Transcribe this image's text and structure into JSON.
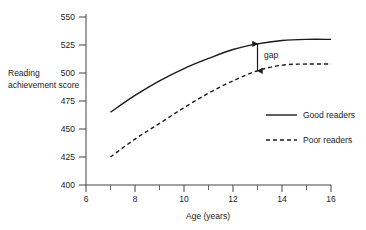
{
  "chart_data": {
    "type": "line",
    "title": "",
    "xlabel": "Age (years)",
    "ylabel": "Reading achievement score",
    "xlim": [
      6,
      16
    ],
    "ylim": [
      400,
      550
    ],
    "xticks": [
      6,
      8,
      10,
      12,
      14,
      16
    ],
    "xtick_labels": [
      "6",
      "8",
      "10",
      "12",
      "14",
      "16"
    ],
    "xminor_ticks": [
      7,
      9,
      11,
      13,
      15
    ],
    "yticks": [
      400,
      425,
      450,
      475,
      500,
      525,
      550
    ],
    "ytick_labels": [
      "400",
      "425",
      "450",
      "475",
      "500",
      "525",
      "550"
    ],
    "grid": false,
    "legend_position": "right-middle",
    "x": [
      7,
      8,
      9,
      10,
      11,
      12,
      13,
      14,
      15,
      16
    ],
    "series": [
      {
        "name": "Good readers",
        "style": "solid",
        "color": "#1a1a1a",
        "values": [
          465,
          480,
          493,
          504,
          513,
          521,
          526,
          529,
          530,
          530
        ]
      },
      {
        "name": "Poor readers",
        "style": "dashed",
        "color": "#1a1a1a",
        "values": [
          425,
          441,
          455,
          469,
          482,
          493,
          502,
          507,
          508,
          508
        ]
      }
    ],
    "annotations": [
      {
        "name": "gap",
        "label": "gap",
        "x": 13,
        "y_top": 526,
        "y_bottom": 502,
        "arrow": "double-headed"
      }
    ]
  },
  "legend": {
    "items": [
      {
        "label": "Good readers",
        "style": "solid"
      },
      {
        "label": "Poor readers",
        "style": "dashed"
      }
    ]
  },
  "axes": {
    "x_title": "Age (years)",
    "y_title_lines": [
      "Reading",
      "achievement",
      "score"
    ],
    "y_title": "Reading achievement score"
  }
}
